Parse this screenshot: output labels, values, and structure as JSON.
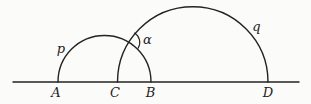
{
  "figure": {
    "background": "#fbfbf9",
    "ink": "#232323",
    "baseline": {
      "y": 82,
      "x1": 13,
      "x2": 299
    },
    "points": [
      {
        "name": "A",
        "label": "A",
        "x": 58,
        "label_x": 56,
        "label_y": 96.5
      },
      {
        "name": "C",
        "label": "C",
        "x": 117.5,
        "label_x": 115,
        "label_y": 96.5
      },
      {
        "name": "B",
        "label": "B",
        "x": 151,
        "label_x": 150.5,
        "label_y": 96.5
      },
      {
        "name": "D",
        "label": "D",
        "x": 268,
        "label_x": 268,
        "label_y": 96.5
      }
    ],
    "semicircles": [
      {
        "name": "p",
        "label": "p",
        "from": "A",
        "to": "B",
        "label_x": 61,
        "label_y": 52.5
      },
      {
        "name": "q",
        "label": "q",
        "from": "C",
        "to": "D",
        "label_x": 256.5,
        "label_y": 31
      }
    ],
    "angle_marker": {
      "label": "α",
      "radius": 11,
      "label_x": 147.5,
      "label_y": 44
    }
  }
}
